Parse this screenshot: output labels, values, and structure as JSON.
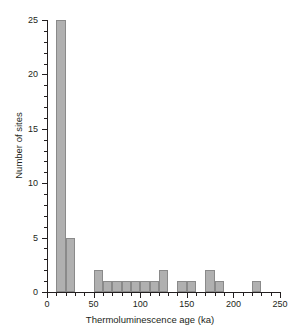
{
  "chart_data": {
    "type": "bar",
    "title": "",
    "subtitle": "",
    "xlabel": "Thermoluminescence age (ka)",
    "ylabel": "Number of sites",
    "xlim": [
      0,
      250
    ],
    "ylim": [
      0,
      25
    ],
    "grid": false,
    "legend": null,
    "bin_width": 10,
    "bar_color": "#b0b0b0",
    "bar_edge_color": "#8a8a8a",
    "axis_color": "#231f20",
    "xticks_major": [
      0,
      50,
      100,
      150,
      200,
      250
    ],
    "xticks_minor": [
      10,
      20,
      30,
      40,
      60,
      70,
      80,
      90,
      110,
      120,
      130,
      140,
      160,
      170,
      180,
      190,
      210,
      220,
      230,
      240
    ],
    "yticks_major": [
      0,
      5,
      10,
      15,
      20,
      25
    ],
    "yticks_minor": [
      1,
      2,
      3,
      4,
      6,
      7,
      8,
      9,
      11,
      12,
      13,
      14,
      16,
      17,
      18,
      19,
      21,
      22,
      23,
      24
    ],
    "xtick_labels": [
      "0",
      "50",
      "100",
      "150",
      "200",
      "250"
    ],
    "ytick_labels": [
      "0",
      "5",
      "10",
      "15",
      "20",
      "25"
    ],
    "bins": [
      {
        "x0": 10,
        "x1": 20,
        "value": 25
      },
      {
        "x0": 20,
        "x1": 30,
        "value": 5
      },
      {
        "x0": 50,
        "x1": 60,
        "value": 2
      },
      {
        "x0": 60,
        "x1": 70,
        "value": 1
      },
      {
        "x0": 70,
        "x1": 80,
        "value": 1
      },
      {
        "x0": 80,
        "x1": 90,
        "value": 1
      },
      {
        "x0": 90,
        "x1": 100,
        "value": 1
      },
      {
        "x0": 100,
        "x1": 110,
        "value": 1
      },
      {
        "x0": 110,
        "x1": 120,
        "value": 1
      },
      {
        "x0": 120,
        "x1": 130,
        "value": 2
      },
      {
        "x0": 140,
        "x1": 150,
        "value": 1
      },
      {
        "x0": 150,
        "x1": 160,
        "value": 1
      },
      {
        "x0": 170,
        "x1": 180,
        "value": 2
      },
      {
        "x0": 180,
        "x1": 190,
        "value": 1
      },
      {
        "x0": 220,
        "x1": 230,
        "value": 1
      }
    ]
  }
}
